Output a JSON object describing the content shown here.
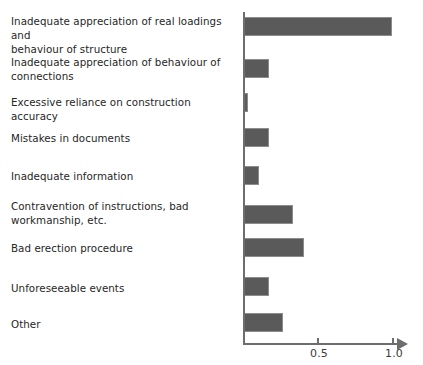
{
  "chart_data": {
    "type": "bar",
    "orientation": "horizontal",
    "title": "",
    "subtitle": "",
    "xlabel": "",
    "ylabel": "",
    "xlim": [
      0,
      1.05
    ],
    "grid": false,
    "legend": null,
    "bar_color": "#5a5a5a",
    "axis_color": "#6d6d6d",
    "tick_labels": [
      "0.5",
      "1.0"
    ],
    "tick_values": [
      0.5,
      1.0
    ],
    "categories": [
      "Inadequate appreciation of real loadings and behaviour of structure",
      "Inadequate appreciation of behaviour of connections",
      "Excessive reliance on construction accuracy",
      "Mistakes in documents",
      "Inadequate information",
      "Contravention of instructions, bad workmanship, etc.",
      "Bad erection procedure",
      "Unforeseeable events",
      "Other"
    ],
    "values": [
      0.99,
      0.17,
      0.03,
      0.17,
      0.1,
      0.33,
      0.4,
      0.17,
      0.26
    ]
  },
  "rows": [
    {
      "label_line1": "Inadequate appreciation of real loadings and",
      "label_line2": "behaviour of structure",
      "value": 0.99
    },
    {
      "label_line1": "Inadequate appreciation of behaviour of",
      "label_line2": "connections",
      "value": 0.17
    },
    {
      "label_line1": "Excessive reliance on construction accuracy",
      "label_line2": "",
      "value": 0.03
    },
    {
      "label_line1": "Mistakes in documents",
      "label_line2": "",
      "value": 0.17
    },
    {
      "label_line1": "Inadequate information",
      "label_line2": "",
      "value": 0.1
    },
    {
      "label_line1": "Contravention of instructions, bad",
      "label_line2": "workmanship, etc.",
      "value": 0.33
    },
    {
      "label_line1": "Bad erection procedure",
      "label_line2": "",
      "value": 0.4
    },
    {
      "label_line1": "Unforeseeable events",
      "label_line2": "",
      "value": 0.17
    },
    {
      "label_line1": "Other",
      "label_line2": "",
      "value": 0.26
    }
  ],
  "axis": {
    "tick_0_5_label": "0.5",
    "tick_1_0_label": "1.0"
  }
}
